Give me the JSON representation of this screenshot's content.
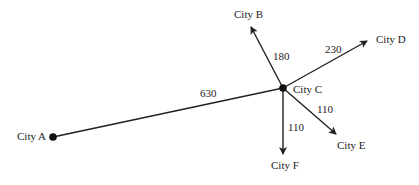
{
  "diagram": {
    "type": "network",
    "nodes": {
      "a": {
        "label": "City A",
        "x": 53,
        "y": 137
      },
      "b": {
        "label": "City B",
        "x": 250,
        "y": 25
      },
      "c": {
        "label": "City C",
        "x": 283,
        "y": 88
      },
      "d": {
        "label": "City D",
        "x": 368,
        "y": 40
      },
      "e": {
        "label": "City E",
        "x": 337,
        "y": 135
      },
      "f": {
        "label": "City F",
        "x": 283,
        "y": 155
      }
    },
    "edges": {
      "ac": {
        "from": "City A",
        "to": "City C",
        "distance": "630"
      },
      "cb": {
        "from": "City C",
        "to": "City B",
        "distance": "180"
      },
      "cd": {
        "from": "City C",
        "to": "City D",
        "distance": "230"
      },
      "ce": {
        "from": "City C",
        "to": "City E",
        "distance": "110"
      },
      "cf": {
        "from": "City C",
        "to": "City F",
        "distance": "110"
      }
    },
    "colors": {
      "line": "#222222",
      "background": "#ffffff"
    }
  }
}
